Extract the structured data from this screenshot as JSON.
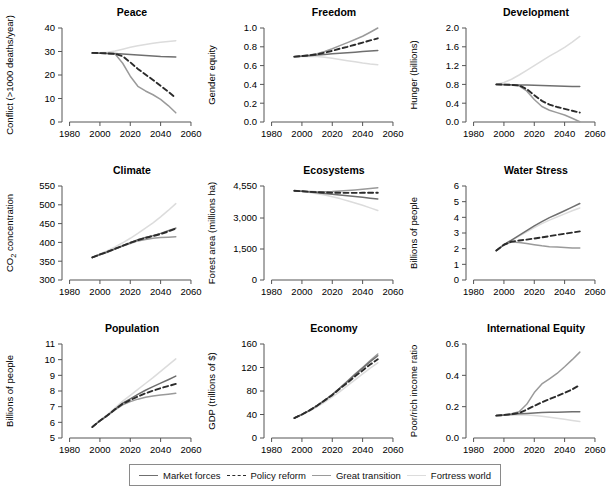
{
  "figure": {
    "panel_count": 9
  },
  "legend": {
    "position": "bottom-center",
    "items": [
      {
        "label": "Market forces",
        "style": "solid",
        "color": "#6f6f6f",
        "width": 1.5
      },
      {
        "label": "Policy reform",
        "style": "dashed",
        "color": "#2b2b2b",
        "width": 1.9
      },
      {
        "label": "Great transition",
        "style": "solid",
        "color": "#9a9a9a",
        "width": 1.5
      },
      {
        "label": "Fortress world",
        "style": "solid",
        "color": "#dcdcdc",
        "width": 1.5
      }
    ]
  },
  "chart_data": [
    {
      "id": "peace",
      "type": "line",
      "title": "Peace",
      "xlabel": "",
      "ylabel": "Conflict (>1000 deaths/year)",
      "xlim": [
        1975,
        2062
      ],
      "ylim": [
        0,
        40
      ],
      "xticks": [
        1980,
        2000,
        2020,
        2040,
        2060
      ],
      "yticks": [
        0,
        10,
        20,
        30,
        40
      ],
      "ytick_labels": [
        "0",
        "10",
        "20",
        "30",
        "40"
      ],
      "x": [
        1995,
        2000,
        2005,
        2010,
        2015,
        2020,
        2025,
        2030,
        2035,
        2040,
        2045,
        2050
      ],
      "series": [
        {
          "name": "Market forces",
          "values": [
            29.4,
            29.3,
            29.2,
            29.1,
            28.9,
            28.7,
            28.5,
            28.3,
            28.1,
            27.9,
            27.8,
            27.7
          ]
        },
        {
          "name": "Policy reform",
          "values": [
            29.4,
            29.3,
            29.2,
            29.0,
            28.0,
            25.4,
            22.6,
            20.2,
            17.9,
            15.4,
            12.9,
            10.3
          ]
        },
        {
          "name": "Great transition",
          "values": [
            29.4,
            29.3,
            29.2,
            28.9,
            25.0,
            19.5,
            15.2,
            13.2,
            11.6,
            9.6,
            7.0,
            3.9
          ]
        },
        {
          "name": "Fortress world",
          "values": [
            29.4,
            29.5,
            29.7,
            30.2,
            31.0,
            31.8,
            32.4,
            33.0,
            33.5,
            33.9,
            34.3,
            34.6
          ]
        }
      ]
    },
    {
      "id": "freedom",
      "type": "line",
      "title": "Freedom",
      "xlabel": "",
      "ylabel": "Gender equity",
      "xlim": [
        1975,
        2062
      ],
      "ylim": [
        0.0,
        1.0
      ],
      "xticks": [
        1980,
        2000,
        2020,
        2040,
        2060
      ],
      "yticks": [
        0.0,
        0.2,
        0.4,
        0.6,
        0.8,
        1.0
      ],
      "ytick_labels": [
        "0.0",
        "0.2",
        "0.4",
        "0.6",
        "0.8",
        "1.0"
      ],
      "x": [
        1995,
        2000,
        2005,
        2010,
        2015,
        2020,
        2025,
        2030,
        2035,
        2040,
        2045,
        2050
      ],
      "series": [
        {
          "name": "Market forces",
          "values": [
            0.695,
            0.7,
            0.706,
            0.712,
            0.718,
            0.725,
            0.731,
            0.737,
            0.743,
            0.749,
            0.755,
            0.76
          ]
        },
        {
          "name": "Policy reform",
          "values": [
            0.695,
            0.702,
            0.71,
            0.72,
            0.737,
            0.757,
            0.78,
            0.8,
            0.822,
            0.845,
            0.868,
            0.89
          ]
        },
        {
          "name": "Great transition",
          "values": [
            0.695,
            0.703,
            0.713,
            0.726,
            0.75,
            0.78,
            0.812,
            0.845,
            0.878,
            0.912,
            0.955,
            1.0
          ]
        },
        {
          "name": "Fortress world",
          "values": [
            0.695,
            0.698,
            0.699,
            0.697,
            0.69,
            0.678,
            0.665,
            0.652,
            0.64,
            0.628,
            0.618,
            0.61
          ]
        }
      ]
    },
    {
      "id": "development",
      "type": "line",
      "title": "Development",
      "xlabel": "",
      "ylabel": "Hunger (billions)",
      "xlim": [
        1975,
        2062
      ],
      "ylim": [
        0.0,
        2.0
      ],
      "xticks": [
        1980,
        2000,
        2020,
        2040,
        2060
      ],
      "yticks": [
        0.0,
        0.4,
        0.8,
        1.2,
        1.6,
        2.0
      ],
      "ytick_labels": [
        "0.0",
        "0.4",
        "0.8",
        "1.2",
        "1.6",
        "2.0"
      ],
      "x": [
        1995,
        2000,
        2005,
        2010,
        2015,
        2020,
        2025,
        2030,
        2035,
        2040,
        2045,
        2050
      ],
      "series": [
        {
          "name": "Market forces",
          "values": [
            0.8,
            0.797,
            0.793,
            0.789,
            0.785,
            0.78,
            0.775,
            0.77,
            0.765,
            0.76,
            0.757,
            0.755
          ]
        },
        {
          "name": "Policy reform",
          "values": [
            0.8,
            0.796,
            0.79,
            0.778,
            0.7,
            0.57,
            0.45,
            0.37,
            0.32,
            0.28,
            0.24,
            0.2
          ]
        },
        {
          "name": "Great transition",
          "values": [
            0.8,
            0.795,
            0.787,
            0.77,
            0.66,
            0.48,
            0.33,
            0.25,
            0.2,
            0.15,
            0.08,
            0.005
          ]
        },
        {
          "name": "Fortress world",
          "values": [
            0.8,
            0.84,
            0.91,
            1.0,
            1.1,
            1.2,
            1.3,
            1.4,
            1.49,
            1.59,
            1.7,
            1.82
          ]
        }
      ]
    },
    {
      "id": "climate",
      "type": "line",
      "title": "Climate",
      "xlabel": "",
      "ylabel": "CO2 concentration",
      "ylabel_sub": "2",
      "xlim": [
        1975,
        2062
      ],
      "ylim": [
        300,
        550
      ],
      "xticks": [
        1980,
        2000,
        2020,
        2040,
        2060
      ],
      "yticks": [
        300,
        350,
        400,
        450,
        500,
        550
      ],
      "ytick_labels": [
        "300",
        "350",
        "400",
        "450",
        "500",
        "550"
      ],
      "x": [
        1995,
        2000,
        2005,
        2010,
        2015,
        2020,
        2025,
        2030,
        2035,
        2040,
        2045,
        2050
      ],
      "series": [
        {
          "name": "Market forces",
          "values": [
            360,
            368,
            375,
            383,
            391,
            399,
            407,
            413,
            418,
            424,
            431,
            438
          ]
        },
        {
          "name": "Policy reform",
          "values": [
            360,
            368,
            375,
            383,
            391,
            399,
            406,
            412,
            417,
            422,
            429,
            437
          ]
        },
        {
          "name": "Great transition",
          "values": [
            360,
            367,
            374,
            382,
            390,
            397,
            404,
            408,
            411,
            413,
            414,
            415
          ]
        },
        {
          "name": "Fortress world",
          "values": [
            360,
            369,
            378,
            388,
            399,
            411,
            424,
            438,
            452,
            468,
            485,
            503
          ]
        }
      ]
    },
    {
      "id": "ecosystems",
      "type": "line",
      "title": "Ecosystems",
      "xlabel": "",
      "ylabel": "Forest area (millions ha)",
      "xlim": [
        1975,
        2062
      ],
      "ylim": [
        0,
        4550
      ],
      "xticks": [
        1980,
        2000,
        2020,
        2040,
        2060
      ],
      "yticks": [
        0,
        1500,
        3000,
        4550
      ],
      "ytick_labels": [
        "0",
        "1,500",
        "3,000",
        "4,550"
      ],
      "x": [
        1995,
        2000,
        2005,
        2010,
        2015,
        2020,
        2025,
        2030,
        2035,
        2040,
        2045,
        2050
      ],
      "series": [
        {
          "name": "Market forces",
          "values": [
            4320,
            4290,
            4255,
            4220,
            4185,
            4150,
            4110,
            4075,
            4040,
            4000,
            3960,
            3920
          ]
        },
        {
          "name": "Policy reform",
          "values": [
            4320,
            4295,
            4270,
            4250,
            4235,
            4225,
            4220,
            4218,
            4218,
            4220,
            4222,
            4225
          ]
        },
        {
          "name": "Great transition",
          "values": [
            4320,
            4300,
            4285,
            4275,
            4275,
            4285,
            4305,
            4330,
            4360,
            4395,
            4430,
            4465
          ]
        },
        {
          "name": "Fortress world",
          "values": [
            4320,
            4280,
            4230,
            4175,
            4110,
            4030,
            3940,
            3840,
            3730,
            3615,
            3490,
            3360
          ]
        }
      ]
    },
    {
      "id": "water_stress",
      "type": "line",
      "title": "Water Stress",
      "xlabel": "",
      "ylabel": "Billions of people",
      "xlim": [
        1975,
        2062
      ],
      "ylim": [
        0,
        6
      ],
      "xticks": [
        1980,
        2000,
        2020,
        2040,
        2060
      ],
      "yticks": [
        0,
        1,
        2,
        3,
        4,
        5,
        6
      ],
      "ytick_labels": [
        "0",
        "1",
        "2",
        "3",
        "4",
        "5",
        "6"
      ],
      "x": [
        1995,
        2000,
        2005,
        2010,
        2015,
        2020,
        2025,
        2030,
        2035,
        2040,
        2045,
        2050
      ],
      "series": [
        {
          "name": "Market forces",
          "values": [
            1.88,
            2.25,
            2.55,
            2.85,
            3.15,
            3.45,
            3.72,
            3.98,
            4.2,
            4.42,
            4.65,
            4.88
          ]
        },
        {
          "name": "Policy reform",
          "values": [
            1.88,
            2.25,
            2.45,
            2.52,
            2.58,
            2.65,
            2.72,
            2.8,
            2.88,
            2.95,
            3.03,
            3.1
          ]
        },
        {
          "name": "Great transition",
          "values": [
            1.88,
            2.25,
            2.42,
            2.4,
            2.33,
            2.25,
            2.18,
            2.13,
            2.1,
            2.07,
            2.05,
            2.05
          ]
        },
        {
          "name": "Fortress world",
          "values": [
            1.88,
            2.25,
            2.52,
            2.8,
            3.08,
            3.35,
            3.6,
            3.82,
            4.02,
            4.22,
            4.42,
            4.6
          ]
        }
      ]
    },
    {
      "id": "population",
      "type": "line",
      "title": "Population",
      "xlabel": "",
      "ylabel": "Billions of people",
      "xlim": [
        1975,
        2062
      ],
      "ylim": [
        5,
        11
      ],
      "xticks": [
        1980,
        2000,
        2020,
        2040,
        2060
      ],
      "yticks": [
        5,
        6,
        7,
        8,
        9,
        10,
        11
      ],
      "ytick_labels": [
        "5",
        "6",
        "7",
        "8",
        "9",
        "10",
        "11"
      ],
      "x": [
        1995,
        2000,
        2005,
        2010,
        2015,
        2020,
        2025,
        2030,
        2035,
        2040,
        2045,
        2050
      ],
      "series": [
        {
          "name": "Market forces",
          "values": [
            5.7,
            6.1,
            6.45,
            6.85,
            7.22,
            7.5,
            7.78,
            8.05,
            8.28,
            8.5,
            8.72,
            8.95
          ]
        },
        {
          "name": "Policy reform",
          "values": [
            5.7,
            6.1,
            6.45,
            6.83,
            7.18,
            7.42,
            7.65,
            7.85,
            8.02,
            8.18,
            8.32,
            8.45
          ]
        },
        {
          "name": "Great transition",
          "values": [
            5.7,
            6.1,
            6.43,
            6.8,
            7.12,
            7.32,
            7.48,
            7.6,
            7.68,
            7.75,
            7.8,
            7.85
          ]
        },
        {
          "name": "Fortress world",
          "values": [
            5.7,
            6.12,
            6.5,
            6.92,
            7.35,
            7.72,
            8.1,
            8.48,
            8.85,
            9.25,
            9.65,
            10.05
          ]
        }
      ]
    },
    {
      "id": "economy",
      "type": "line",
      "title": "Economy",
      "xlabel": "",
      "ylabel": "GDP (trillions of $)",
      "xlim": [
        1975,
        2062
      ],
      "ylim": [
        0,
        160
      ],
      "xticks": [
        1980,
        2000,
        2020,
        2040,
        2060
      ],
      "yticks": [
        0,
        40,
        80,
        120,
        160
      ],
      "ytick_labels": [
        "0",
        "40",
        "80",
        "120",
        "160"
      ],
      "x": [
        1995,
        2000,
        2005,
        2010,
        2015,
        2020,
        2025,
        2030,
        2035,
        2040,
        2045,
        2050
      ],
      "series": [
        {
          "name": "Market forces",
          "values": [
            34,
            40,
            47,
            55,
            64,
            74,
            85,
            96,
            108,
            119,
            130,
            140
          ]
        },
        {
          "name": "Policy reform",
          "values": [
            34,
            40,
            47,
            55,
            64,
            73,
            84,
            94,
            105,
            115,
            125,
            134
          ]
        },
        {
          "name": "Great transition",
          "values": [
            34,
            40,
            47,
            55,
            64,
            74,
            85,
            97,
            109,
            120,
            132,
            143
          ]
        },
        {
          "name": "Fortress world",
          "values": [
            34,
            40,
            46,
            53,
            61,
            70,
            79,
            89,
            99,
            109,
            119,
            128
          ]
        }
      ]
    },
    {
      "id": "international_equity",
      "type": "line",
      "title": "International Equity",
      "xlabel": "",
      "ylabel": "Poor/rich income ratio",
      "xlim": [
        1975,
        2062
      ],
      "ylim": [
        0.0,
        0.6
      ],
      "xticks": [
        1980,
        2000,
        2020,
        2040,
        2060
      ],
      "yticks": [
        0.0,
        0.2,
        0.4,
        0.6
      ],
      "ytick_labels": [
        "0.0",
        "0.2",
        "0.4",
        "0.6"
      ],
      "x": [
        1995,
        2000,
        2005,
        2010,
        2015,
        2020,
        2025,
        2030,
        2035,
        2040,
        2045,
        2050
      ],
      "series": [
        {
          "name": "Market forces",
          "values": [
            0.143,
            0.146,
            0.15,
            0.154,
            0.157,
            0.16,
            0.162,
            0.164,
            0.165,
            0.166,
            0.167,
            0.168
          ]
        },
        {
          "name": "Policy reform",
          "values": [
            0.143,
            0.147,
            0.152,
            0.16,
            0.181,
            0.205,
            0.228,
            0.248,
            0.268,
            0.288,
            0.31,
            0.338
          ]
        },
        {
          "name": "Great transition",
          "values": [
            0.143,
            0.148,
            0.155,
            0.168,
            0.215,
            0.29,
            0.345,
            0.378,
            0.412,
            0.455,
            0.5,
            0.548
          ]
        },
        {
          "name": "Fortress world",
          "values": [
            0.143,
            0.145,
            0.147,
            0.148,
            0.147,
            0.144,
            0.139,
            0.133,
            0.126,
            0.119,
            0.112,
            0.105
          ]
        }
      ]
    }
  ]
}
